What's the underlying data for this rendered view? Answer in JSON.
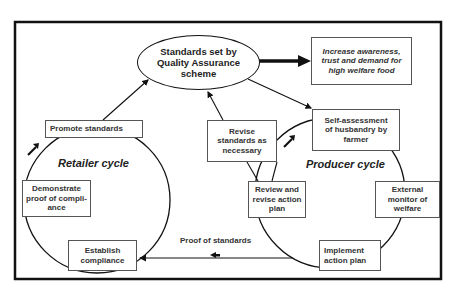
{
  "diagram": {
    "central_node": {
      "label": "Standards set by\nQuality Assurance\nscheme"
    },
    "outcome_node": {
      "label": "Increase awareness,\ntrust and demand for\nhigh welfare food"
    },
    "shared_node": {
      "label": "Revise\nstandards as\nnecessary"
    },
    "retailer_cycle": {
      "title": "Retailer cycle",
      "steps": [
        {
          "label": "Promote standards"
        },
        {
          "label": "Demonstrate\nproof of compli-\nance"
        },
        {
          "label": "Establish\ncompliance"
        }
      ]
    },
    "producer_cycle": {
      "title": "Producer cycle",
      "steps": [
        {
          "label": "Self-assessment\nof husbandry by\nfarmer"
        },
        {
          "label": "External\nmonitor of\nwelfare"
        },
        {
          "label": "Implement\naction plan"
        },
        {
          "label": "Review and\nrevise action\nplan"
        }
      ]
    },
    "flow_label": "Proof of standards",
    "colors": {
      "line": "#111111",
      "box_border": "#555555",
      "background": "#ffffff"
    }
  }
}
